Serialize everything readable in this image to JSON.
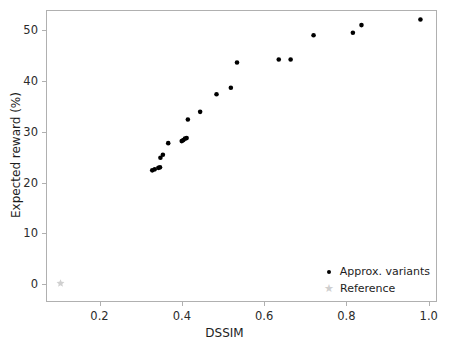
{
  "chart_data": {
    "type": "scatter",
    "title": "",
    "xlabel": "DSSIM",
    "ylabel": "Expected reward (%)",
    "xlim": [
      0.07,
      1.02
    ],
    "ylim": [
      -3.5,
      54.0
    ],
    "grid": false,
    "legend_position": "lower right",
    "xticks": [
      0.2,
      0.4,
      0.6,
      0.8,
      1.0
    ],
    "xticklabels": [
      "0.2",
      "0.4",
      "0.6",
      "0.8",
      "1.0"
    ],
    "yticks": [
      0,
      10,
      20,
      30,
      40,
      50
    ],
    "yticklabels": [
      "0",
      "10",
      "20",
      "30",
      "40",
      "50"
    ],
    "series": [
      {
        "name": "Approx. variants",
        "marker": "circle",
        "color": "#000000",
        "points": [
          {
            "x": 0.327,
            "y": 22.4
          },
          {
            "x": 0.333,
            "y": 22.6
          },
          {
            "x": 0.342,
            "y": 22.9
          },
          {
            "x": 0.346,
            "y": 23.0
          },
          {
            "x": 0.347,
            "y": 24.9
          },
          {
            "x": 0.353,
            "y": 25.5
          },
          {
            "x": 0.366,
            "y": 27.8
          },
          {
            "x": 0.399,
            "y": 28.2
          },
          {
            "x": 0.403,
            "y": 28.4
          },
          {
            "x": 0.407,
            "y": 28.7
          },
          {
            "x": 0.411,
            "y": 28.8
          },
          {
            "x": 0.414,
            "y": 32.5
          },
          {
            "x": 0.444,
            "y": 34.0
          },
          {
            "x": 0.484,
            "y": 37.5
          },
          {
            "x": 0.519,
            "y": 38.8
          },
          {
            "x": 0.534,
            "y": 43.8
          },
          {
            "x": 0.636,
            "y": 44.4
          },
          {
            "x": 0.665,
            "y": 44.4
          },
          {
            "x": 0.721,
            "y": 49.2
          },
          {
            "x": 0.817,
            "y": 49.7
          },
          {
            "x": 0.838,
            "y": 51.2
          },
          {
            "x": 0.982,
            "y": 52.3
          }
        ]
      },
      {
        "name": "Reference",
        "marker": "star",
        "color": "#d0d0d0",
        "points": [
          {
            "x": 0.103,
            "y": 0.0
          }
        ]
      }
    ]
  },
  "legend": {
    "entries": [
      {
        "label": "Approx. variants",
        "marker": "circle",
        "color": "#000000"
      },
      {
        "label": "Reference",
        "marker": "star",
        "color": "#d0d0d0"
      }
    ]
  },
  "axes": {
    "x_title": "DSSIM",
    "y_title": "Expected reward (%)"
  },
  "colors": {
    "variant_marker": "#000000",
    "reference_marker": "#d0d0d0",
    "spine": "#b0b0b0",
    "text": "#1d1d1d",
    "background": "#ffffff"
  }
}
